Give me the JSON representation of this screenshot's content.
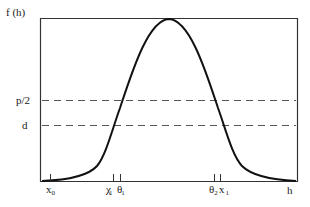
{
  "diagram": {
    "y_axis_label": "f (h)",
    "x_axis_label": "h",
    "horizontal_lines": [
      {
        "label": "p/2",
        "y": 100,
        "style": "dashed"
      },
      {
        "label": "d",
        "y": 125,
        "style": "dashed"
      }
    ],
    "x_ticks": [
      {
        "label": "x",
        "sub": "0",
        "x": 50
      },
      {
        "label": "χ",
        "sub": "1",
        "x": 113
      },
      {
        "label": "θ",
        "sub": "1",
        "x": 120
      },
      {
        "label": "θ",
        "sub": "2",
        "x": 214
      },
      {
        "label": "x",
        "sub": "1",
        "x": 221
      }
    ],
    "curve": {
      "description": "bell-shaped density curve f(h) peaking at top of frame",
      "color": "#111111"
    },
    "colors": {
      "frame": "#333333",
      "dashed": "#555555",
      "curve": "#111111"
    }
  }
}
